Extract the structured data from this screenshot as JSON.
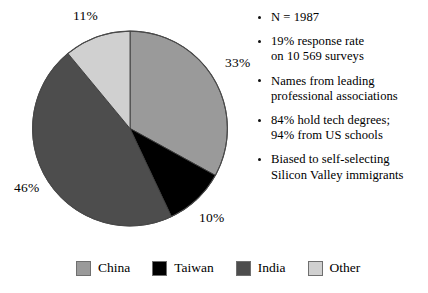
{
  "chart_data": {
    "type": "pie",
    "title": "",
    "categories": [
      "China",
      "Taiwan",
      "India",
      "Other"
    ],
    "values": [
      33,
      10,
      46,
      11
    ],
    "value_labels": [
      "33%",
      "10%",
      "46%",
      "11%"
    ],
    "colors": [
      "#9a9a9a",
      "#000000",
      "#4d4d4d",
      "#d0d0d0"
    ],
    "start_angle_deg": 0,
    "direction": "clockwise",
    "units": "percent",
    "legend_position": "bottom",
    "grid": false
  },
  "labels": {
    "other": "11%",
    "china": "33%",
    "india": "46%",
    "taiwan": "10%"
  },
  "notes": [
    {
      "lines": [
        "N = 1987"
      ]
    },
    {
      "lines": [
        "19% response rate",
        "on 10 569 surveys"
      ]
    },
    {
      "lines": [
        "Names from leading",
        "professional associations"
      ]
    },
    {
      "lines": [
        "84% hold tech degrees;",
        "94% from US schools"
      ]
    },
    {
      "lines": [
        "Biased to self-selecting",
        "Silicon Valley immigrants"
      ]
    }
  ],
  "legend": {
    "items": [
      {
        "label": "China",
        "color": "#9a9a9a"
      },
      {
        "label": "Taiwan",
        "color": "#000000"
      },
      {
        "label": "India",
        "color": "#4d4d4d"
      },
      {
        "label": "Other",
        "color": "#d0d0d0"
      }
    ]
  }
}
